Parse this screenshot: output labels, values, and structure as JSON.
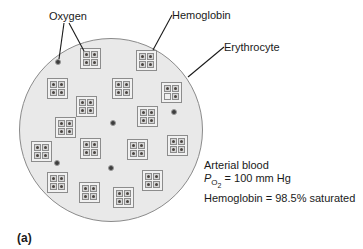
{
  "figure": {
    "panel_label": "(a)",
    "callouts": {
      "oxygen": "Oxygen",
      "hemoglobin": "Hemoglobin",
      "erythrocyte": "Erythrocyte"
    },
    "annotation": {
      "line1": "Arterial blood",
      "po2_symbol": "P",
      "po2_sub": "O",
      "po2_subsub": "2",
      "po2_value": " = 100 mm Hg",
      "line3": "Hemoglobin = 98.5% saturated"
    },
    "colors": {
      "cell_fill": "#e9e9e9",
      "cell_border": "#8a8a8a",
      "heme_fill": "#f1f1f1",
      "site_fill": "#d7d7d7",
      "site_border": "#8c8c8c",
      "oxygen_dot": "#4b4642",
      "pointer_line": "#1a1a1a"
    },
    "cell": {
      "x": 19,
      "y": 38,
      "d": 184
    },
    "hemoglobins": [
      {
        "x": 80,
        "y": 48
      },
      {
        "x": 136,
        "y": 50
      },
      {
        "x": 47,
        "y": 78
      },
      {
        "x": 112,
        "y": 78
      },
      {
        "x": 161,
        "y": 82,
        "empty": "bl"
      },
      {
        "x": 76,
        "y": 96
      },
      {
        "x": 55,
        "y": 117
      },
      {
        "x": 137,
        "y": 106
      },
      {
        "x": 31,
        "y": 141
      },
      {
        "x": 80,
        "y": 138
      },
      {
        "x": 127,
        "y": 139
      },
      {
        "x": 167,
        "y": 135
      },
      {
        "x": 47,
        "y": 172
      },
      {
        "x": 79,
        "y": 182
      },
      {
        "x": 113,
        "y": 187
      },
      {
        "x": 142,
        "y": 170
      }
    ],
    "free_oxygen": [
      {
        "x": 58,
        "y": 62
      },
      {
        "x": 113,
        "y": 123
      },
      {
        "x": 174,
        "y": 112
      },
      {
        "x": 57,
        "y": 163
      },
      {
        "x": 111,
        "y": 168
      }
    ],
    "pointer_lines": [
      {
        "name": "oxygen-pointer-to-free-oxygen",
        "x1": 64,
        "y1": 23,
        "x2": 59,
        "y2": 59
      },
      {
        "name": "oxygen-pointer-to-hemoglobin",
        "x1": 69,
        "y1": 23,
        "x2": 84,
        "y2": 51
      },
      {
        "name": "hemoglobin-pointer",
        "x1": 172,
        "y1": 15,
        "x2": 153,
        "y2": 50
      },
      {
        "name": "erythrocyte-pointer",
        "x1": 224,
        "y1": 47,
        "x2": 188,
        "y2": 77
      }
    ]
  }
}
